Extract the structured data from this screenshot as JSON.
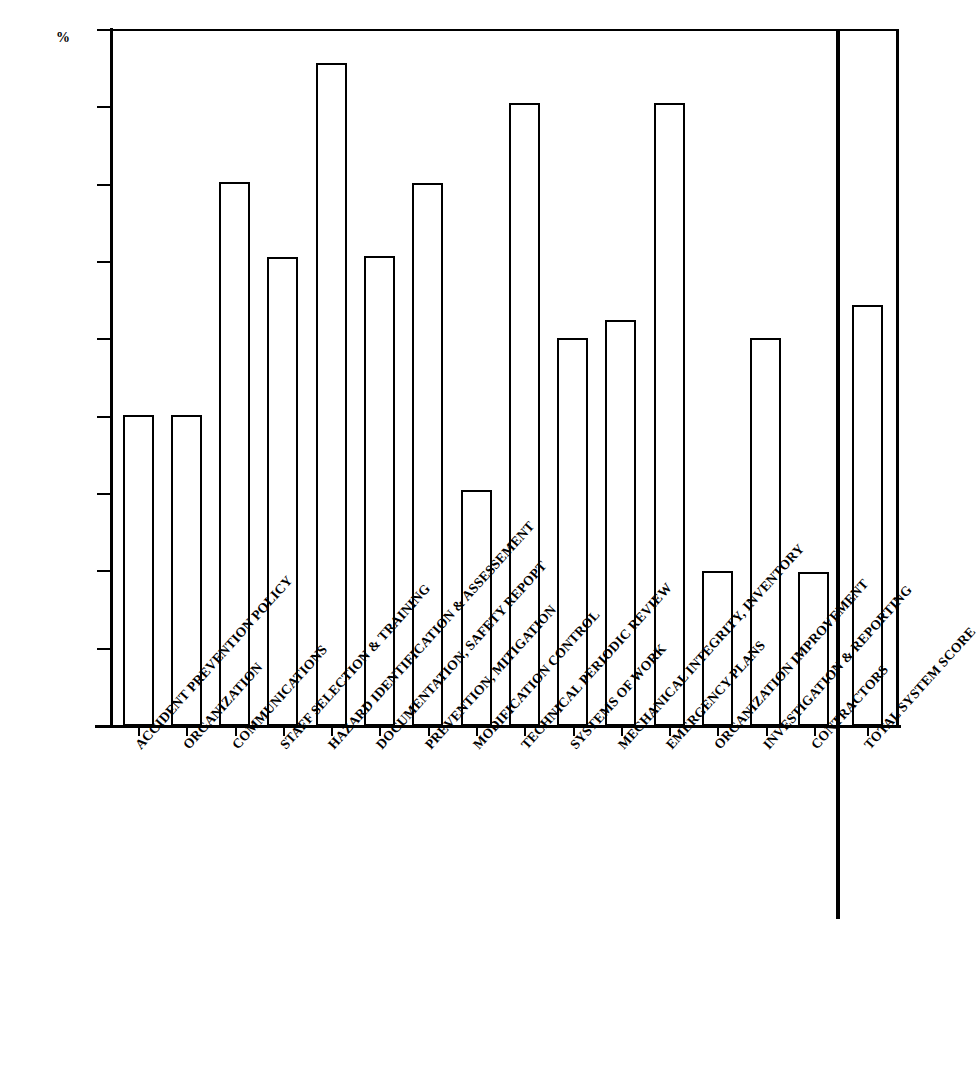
{
  "chart_data": {
    "type": "bar",
    "title": "",
    "xlabel": "",
    "ylabel": "%",
    "ylim": [
      0,
      90
    ],
    "ytick_values": [
      0,
      10,
      20,
      30,
      40,
      50,
      60,
      70,
      80,
      90
    ],
    "ytick_labels": [
      "0",
      "10",
      "20",
      "30",
      "40",
      "50",
      "60",
      "70",
      "80",
      "90"
    ],
    "grid": false,
    "legend": null,
    "bar_style": {
      "fill": "#ffffff",
      "edge": "#000000"
    },
    "categories": [
      "ACCIDENT  PREVENTION POLICY",
      "ORGANIZATION",
      "COMMUNICATIONS",
      "STAFF SELECTION & TRAINING",
      "HAZARD IDENTIFICATION & ASSESSEMENT",
      "DOCUMENTATION, SAFETY REPOPT",
      "PREVENTION, MITIGATION",
      "MODIFICATION CONTROL",
      "TECHNICAL PERIODIC REVIEW",
      "SYSTEMS OF WORK",
      "MECHANICAL INTEGRITY, INVENTORY",
      "EMERGENCY PLANS",
      "ORGANIZATION IMPROVEMENT",
      "INVESTIGATION & REPORTING",
      "CONTRACTORS",
      "TOTAL SYSTEM SCORE"
    ],
    "values": [
      40.2,
      40.2,
      70.3,
      60.6,
      85.7,
      60.8,
      70.2,
      30.5,
      80.6,
      50.2,
      52.5,
      80.5,
      20.1,
      50.2,
      19.9,
      54.4
    ],
    "separator_before_index": 15,
    "annotations": []
  }
}
